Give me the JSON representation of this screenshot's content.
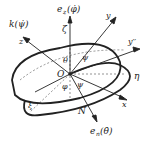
{
  "diagram": {
    "labels": {
      "k_psi": "k(ψ̇)",
      "z": "z",
      "ez_phi": "e_z(φ̇)",
      "ez_main": "e",
      "ez_sub": "z",
      "ez_arg": "(φ̇)",
      "zeta": "ζ",
      "y": "y",
      "y_dprime": "y′′",
      "eta": "η",
      "theta": "θ",
      "psi": "ψ",
      "O": "O",
      "phi": "φ",
      "psi2": "ψ",
      "x": "x",
      "xi": "ξ",
      "N": "N",
      "en_main": "e",
      "en_sub": "n",
      "en_arg": "(θ̇)"
    },
    "colors": {
      "line": "#222222",
      "dashed": "#555555"
    }
  }
}
